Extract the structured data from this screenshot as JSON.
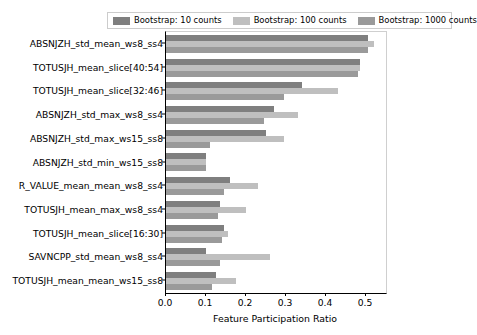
{
  "chart_data": {
    "type": "bar",
    "orientation": "horizontal",
    "title": "",
    "xlabel": "Feature Participation Ratio",
    "ylabel": "",
    "xlim": [
      0.0,
      0.55
    ],
    "xticks": [
      0.0,
      0.1,
      0.2,
      0.3,
      0.4,
      0.5
    ],
    "xtick_labels": [
      "0.0",
      "0.1",
      "0.2",
      "0.3",
      "0.4",
      "0.5"
    ],
    "grid": false,
    "legend_position": "upper center",
    "categories": [
      "ABSNJZH_std_mean_ws8_ss4",
      "TOTUSJH_mean_slice[40:54]",
      "TOTUSJH_mean_slice[32:46]",
      "ABSNJZH_std_max_ws8_ss4",
      "ABSNJZH_std_max_ws15_ss8",
      "ABSNJZH_std_min_ws15_ss8",
      "R_VALUE_mean_mean_ws8_ss4",
      "TOTUSJH_mean_max_ws8_ss4",
      "TOTUSJH_mean_slice[16:30]",
      "SAVNCPP_std_mean_ws8_ss4",
      "TOTUSJH_mean_mean_ws15_ss8"
    ],
    "series": [
      {
        "name": "Bootstrap: 10 counts",
        "color": "#7f7f7f",
        "values": [
          0.505,
          0.485,
          0.34,
          0.27,
          0.25,
          0.1,
          0.16,
          0.135,
          0.145,
          0.1,
          0.125
        ]
      },
      {
        "name": "Bootstrap: 100 counts",
        "color": "#bfbfbf",
        "values": [
          0.52,
          0.485,
          0.43,
          0.33,
          0.295,
          0.1,
          0.23,
          0.2,
          0.155,
          0.26,
          0.175
        ]
      },
      {
        "name": "Bootstrap: 1000 counts",
        "color": "#9a9a9a",
        "values": [
          0.505,
          0.48,
          0.295,
          0.245,
          0.11,
          0.1,
          0.145,
          0.13,
          0.14,
          0.135,
          0.115
        ]
      }
    ]
  },
  "legend": {
    "entries": [
      {
        "label": "Bootstrap: 10 counts",
        "color": "#7f7f7f"
      },
      {
        "label": "Bootstrap: 100 counts",
        "color": "#bfbfbf"
      },
      {
        "label": "Bootstrap: 1000 counts",
        "color": "#9a9a9a"
      }
    ]
  }
}
